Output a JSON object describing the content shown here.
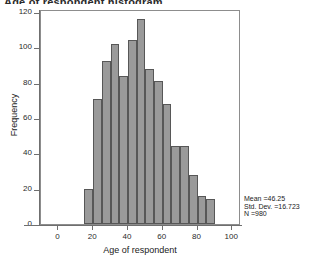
{
  "chart_data": {
    "type": "bar",
    "title": "Age of respondent histogram",
    "xlabel": "Age of respondent",
    "ylabel": "Frequency",
    "xlim": [
      0,
      100
    ],
    "ylim": [
      0,
      120
    ],
    "grid": false,
    "legend": null,
    "bin_width": 5,
    "categories": [
      "15-20",
      "20-25",
      "25-30",
      "30-35",
      "35-40",
      "40-45",
      "45-50",
      "50-55",
      "55-60",
      "60-65",
      "65-70",
      "70-75",
      "75-80",
      "80-85",
      "85-90"
    ],
    "bin_starts": [
      15,
      20,
      25,
      30,
      35,
      40,
      45,
      50,
      55,
      60,
      65,
      70,
      75,
      80,
      85
    ],
    "values": [
      20,
      71,
      92,
      102,
      84,
      104,
      116,
      88,
      81,
      68,
      44,
      44,
      28,
      16,
      14
    ],
    "x_ticks": [
      0,
      20,
      40,
      60,
      80,
      100
    ],
    "y_ticks": [
      0,
      20,
      40,
      60,
      80,
      100,
      120
    ],
    "bar_color": "#9a9a9a",
    "bar_border_color": "#575757",
    "annotations": {
      "mean_label": "Mean =46.25",
      "std_dev_label": "Std. Dev. =16.723",
      "n_label": "N =980"
    }
  }
}
